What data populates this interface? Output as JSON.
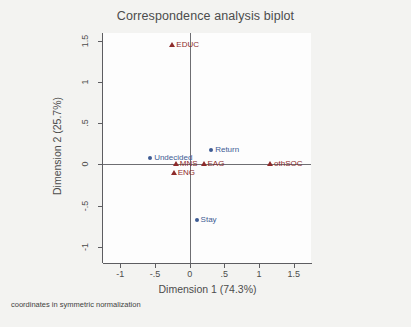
{
  "chart_data": {
    "type": "scatter",
    "title": "Correspondence analysis biplot",
    "xlabel": "Dimension 1 (74.3%)",
    "ylabel": "Dimension 2 (25.7%)",
    "xlim": [
      -1.25,
      1.75
    ],
    "ylim": [
      -1.2,
      1.6
    ],
    "xticks": [
      "-1",
      "-.5",
      "0",
      ".5",
      "1",
      "1.5"
    ],
    "xtick_values": [
      -1,
      -0.5,
      0,
      0.5,
      1,
      1.5
    ],
    "yticks": [
      "-1",
      "-.5",
      "0",
      ".5",
      "1",
      "1.5"
    ],
    "ytick_values": [
      -1,
      -0.5,
      0,
      0.5,
      1,
      1.5
    ],
    "grid": false,
    "legend": "none",
    "reference_lines": {
      "x": 0,
      "y": 0
    },
    "footnote": "coordinates in symmetric normalization",
    "series": [
      {
        "name": "row-coordinates",
        "marker": "circle",
        "color": "#3e5c94",
        "points": [
          {
            "label": "Undecided",
            "x": -0.57,
            "y": 0.08
          },
          {
            "label": "Return",
            "x": 0.31,
            "y": 0.18
          },
          {
            "label": "Stay",
            "x": 0.1,
            "y": -0.68
          }
        ]
      },
      {
        "name": "column-coordinates",
        "marker": "triangle",
        "color": "#8d2b2b",
        "points": [
          {
            "label": "EDUC",
            "x": -0.25,
            "y": 1.45
          },
          {
            "label": "MNS",
            "x": -0.2,
            "y": 0.0
          },
          {
            "label": "EAG",
            "x": 0.2,
            "y": 0.0
          },
          {
            "label": "othSOC",
            "x": 1.16,
            "y": 0.0
          },
          {
            "label": "ENG",
            "x": -0.23,
            "y": -0.1
          }
        ]
      }
    ]
  },
  "colors": {
    "rows": "#3e5c94",
    "columns": "#8d2b2b",
    "axis": "#5d5d61",
    "text": "#4c4c4c",
    "panel": "#fdfdfd",
    "background": "#f3f3f1"
  }
}
